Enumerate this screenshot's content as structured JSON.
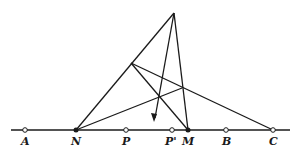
{
  "diagram": {
    "baseline": {
      "x1": 11,
      "x2": 290,
      "y": 130
    },
    "apex": {
      "x": 174,
      "y": 13
    },
    "upper_point": {
      "x": 131,
      "y": 63
    },
    "mid_point": {
      "x": 182,
      "y": 88
    },
    "arrow_tip": {
      "x": 154,
      "y": 121
    },
    "points": [
      {
        "label": "A",
        "x": 25,
        "filled": false
      },
      {
        "label": "N",
        "x": 76,
        "filled": true
      },
      {
        "label": "P",
        "x": 126,
        "filled": false
      },
      {
        "label": "P'",
        "x": 172,
        "filled": false
      },
      {
        "label": "M",
        "x": 188,
        "filled": true
      },
      {
        "label": "B",
        "x": 226,
        "filled": false
      },
      {
        "label": "C",
        "x": 273,
        "filled": false
      }
    ],
    "colors": {
      "ink": "#1a1a1a",
      "background": "#ffffff"
    }
  }
}
